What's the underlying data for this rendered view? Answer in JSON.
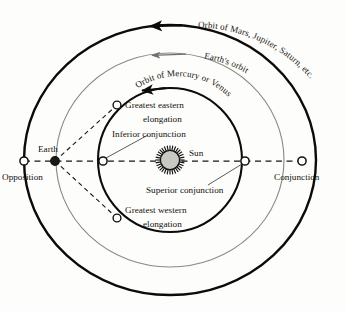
{
  "diagram": {
    "background_color": "#fdfdfb",
    "center": {
      "x": 170,
      "y": 160
    },
    "colors": {
      "outer_orbit": "#0d0b09",
      "earth_orbit": "#8a8a86",
      "inner_orbit": "#0d0b09",
      "sun_body": "#c9c9c4",
      "sun_rays": "#141210",
      "dashed_line": "#181613",
      "leader_line": "#4a4743",
      "text": "#14120f"
    },
    "orbits": [
      {
        "name": "inner-orbit",
        "label": "Orbit of Mercury or Venus",
        "rx": 72,
        "ry": 72,
        "stroke": "#0d0b09",
        "stroke_width": 2.1,
        "direction": "counterclockwise"
      },
      {
        "name": "earth-orbit",
        "label": "Earth's orbit",
        "rx": 114,
        "ry": 107,
        "stroke": "#8a8a86",
        "stroke_width": 1.1,
        "direction": "counterclockwise"
      },
      {
        "name": "outer-orbit",
        "label": "Orbit of Mars, Jupiter, Saturn, etc.",
        "rx": 146,
        "ry": 135,
        "stroke": "#0d0b09",
        "stroke_width": 2.4,
        "direction": "counterclockwise"
      }
    ],
    "bodies": {
      "sun": {
        "label": "Sun",
        "x": 170,
        "y": 160,
        "radius": 10,
        "marker": "sun-disc-with-rays"
      },
      "earth": {
        "label": "Earth",
        "x": 55,
        "y": 161,
        "radius": 4,
        "marker": "filled-dot"
      }
    },
    "points": [
      {
        "name": "opposition",
        "label": "Opposition",
        "x": 24,
        "y": 161,
        "marker": "open-circle"
      },
      {
        "name": "inferior-conjunction",
        "label": "Inferior conjunction",
        "x": 103,
        "y": 161,
        "marker": "open-circle"
      },
      {
        "name": "superior-conjunction",
        "label": "Superior conjunction",
        "x": 245,
        "y": 161,
        "marker": "open-circle"
      },
      {
        "name": "conjunction",
        "label": "Conjunction",
        "x": 302,
        "y": 161,
        "marker": "open-circle"
      },
      {
        "name": "greatest-eastern-elongation",
        "label": "Greatest  eastern elongation",
        "x": 117,
        "y": 105,
        "marker": "open-circle"
      },
      {
        "name": "greatest-western-elongation",
        "label": "Greatest  western elongation",
        "x": 117,
        "y": 218,
        "marker": "open-circle"
      }
    ],
    "labels": {
      "orbit_outer": "Orbit of Mars, Jupiter, Saturn, etc.",
      "orbit_earth": "Earth's orbit",
      "orbit_inner": "Orbit of Mercury or Venus",
      "sun": "Sun",
      "earth": "Earth",
      "opposition": "Opposition",
      "conjunction": "Conjunction",
      "inferior_conjunction": "Inferior conjunction",
      "superior_conjunction": "Superior conjunction",
      "greatest_eastern_line1": "Greatest  eastern",
      "greatest_eastern_line2": "elongation",
      "greatest_western_line1": "Greatest  western",
      "greatest_western_line2": "elongation"
    },
    "arrows": [
      {
        "name": "outer-orbit-direction-arrow",
        "on": "outer-orbit",
        "points_toward": "left"
      },
      {
        "name": "earth-orbit-direction-arrow",
        "on": "earth-orbit",
        "points_toward": "left"
      },
      {
        "name": "inner-orbit-direction-arrow",
        "on": "inner-orbit",
        "points_toward": "left"
      }
    ]
  }
}
